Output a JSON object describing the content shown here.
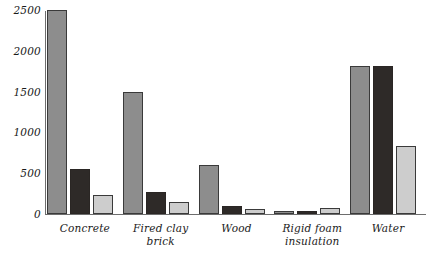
{
  "chart_data": {
    "type": "bar",
    "title": "",
    "xlabel": "",
    "ylabel": "",
    "ylim": [
      0,
      2500
    ],
    "yticks": [
      0,
      500,
      1000,
      1500,
      2000,
      2500
    ],
    "ytick_labels": [
      "0",
      "500",
      "1000",
      "1500",
      "2000",
      "2500"
    ],
    "grid": false,
    "legend": "none",
    "categories": [
      "Concrete",
      "Fired clay brick",
      "Wood",
      "Rigid foam\ninsulation",
      "Water"
    ],
    "series": [
      {
        "name": "series-1",
        "color": "#8d8d8d",
        "values": [
          2500,
          1500,
          600,
          30,
          1810
        ]
      },
      {
        "name": "series-2",
        "color": "#2e2a28",
        "values": [
          550,
          270,
          100,
          30,
          1810
        ]
      },
      {
        "name": "series-3",
        "color": "#cdcdcd",
        "values": [
          230,
          150,
          60,
          70,
          830
        ]
      }
    ]
  },
  "colors": {
    "background": "#ffffff",
    "axis": "#6d6d6d",
    "text": "#1a1a1a",
    "bar_medium_gray": "#8d8d8d",
    "bar_dark": "#2e2a28",
    "bar_light_gray": "#cdcdcd"
  }
}
